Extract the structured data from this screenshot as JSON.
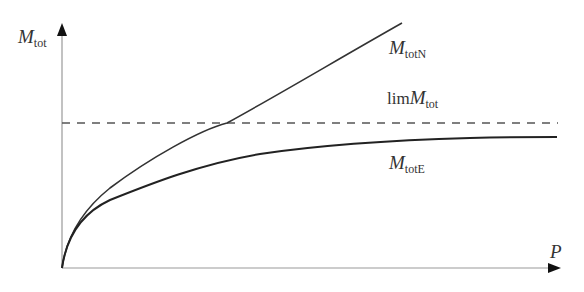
{
  "diagram": {
    "y_axis_label": {
      "main": "M",
      "sub": "tot"
    },
    "x_axis_label": "P",
    "curves": [
      {
        "id": "MtotN",
        "label_main": "M",
        "label_sub": "totN",
        "style": "solid"
      },
      {
        "id": "limMtot",
        "label_prefix": "lim",
        "label_main": "M",
        "label_sub": "tot",
        "style": "dashed"
      },
      {
        "id": "MtotE",
        "label_main": "M",
        "label_sub": "totE",
        "style": "solid"
      }
    ],
    "colors": {
      "axis": "#888888",
      "curve": "#333333",
      "dashed": "#555555"
    }
  }
}
